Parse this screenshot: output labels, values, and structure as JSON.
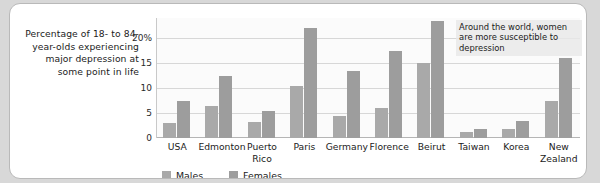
{
  "caption": "Percentage of 18- to 84-year-olds experiencing major depression at some point in life",
  "annotation": "Around the world, women are more susceptible to depression",
  "legend": {
    "males": {
      "label": "Males",
      "color": "#a9a9a9"
    },
    "females": {
      "label": "Females",
      "color": "#9d9d9d"
    }
  },
  "yticks": [
    "20%",
    "15",
    "10",
    "5",
    "0"
  ],
  "chart_data": {
    "type": "bar",
    "title": "",
    "xlabel": "",
    "ylabel": "Percentage of 18- to 84-year-olds experiencing major depression at some point in life",
    "ylim": [
      0,
      24
    ],
    "ytick_values": [
      20,
      15,
      10,
      5,
      0
    ],
    "ytick_labels": [
      "20%",
      "15",
      "10",
      "5",
      "0"
    ],
    "grid": true,
    "legend_position": "bottom-left",
    "categories": [
      "USA",
      "Edmonton",
      "Puerto Rico",
      "Paris",
      "Germany",
      "Florence",
      "Beirut",
      "Taiwan",
      "Korea",
      "New Zealand"
    ],
    "series": [
      {
        "name": "Males",
        "color": "#a9a9a9",
        "values": [
          3.0,
          6.5,
          3.2,
          10.5,
          4.5,
          6.0,
          15.0,
          1.2,
          1.8,
          7.5
        ]
      },
      {
        "name": "Females",
        "color": "#9d9d9d",
        "values": [
          7.5,
          12.5,
          5.5,
          22.0,
          13.5,
          17.5,
          23.5,
          1.8,
          3.5,
          16.0
        ]
      }
    ],
    "annotations": [
      {
        "text": "Around the world, women are more susceptible to depression"
      }
    ]
  }
}
